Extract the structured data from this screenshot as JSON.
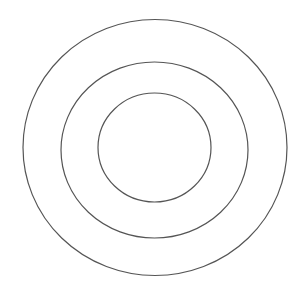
{
  "diagram": {
    "type": "concentric-circles",
    "background": "#ffffff",
    "stroke_color": "#555555",
    "stroke_width": 1.2,
    "circles": [
      {
        "name": "outer-circle",
        "cx": 155,
        "cy": 147.5,
        "rx": 132,
        "ry": 128
      },
      {
        "name": "middle-circle",
        "cx": 154.5,
        "cy": 150,
        "rx": 93.5,
        "ry": 88
      },
      {
        "name": "inner-circle",
        "cx": 154.5,
        "cy": 147.5,
        "rx": 56.5,
        "ry": 54.5
      }
    ]
  }
}
